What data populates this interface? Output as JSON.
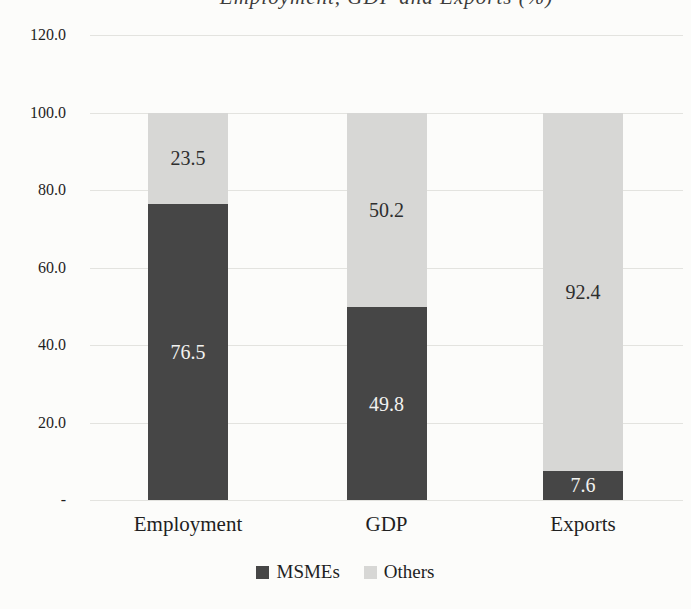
{
  "chart_data": {
    "type": "bar",
    "stacked": true,
    "title": "Employment, GDP and Exports (%)",
    "title_partially_cropped": true,
    "categories": [
      "Employment",
      "GDP",
      "Exports"
    ],
    "series": [
      {
        "name": "MSMEs",
        "color": "#464646",
        "label_color": "#f2f2f0",
        "values": [
          76.5,
          49.8,
          7.6
        ]
      },
      {
        "name": "Others",
        "color": "#d7d7d5",
        "label_color": "#2e2e2e",
        "values": [
          23.5,
          50.2,
          92.4
        ]
      }
    ],
    "ylim": [
      0,
      120
    ],
    "ytick_step": 20,
    "ytick_labels": [
      "-",
      "20.0",
      "40.0",
      "60.0",
      "80.0",
      "100.0",
      "120.0"
    ],
    "grid": "horizontal-faint",
    "legend_position": "bottom-center"
  },
  "colors": {
    "background": "#fcfcfa",
    "gridline": "#e3e3df",
    "axis_text": "#1f1f1f"
  }
}
